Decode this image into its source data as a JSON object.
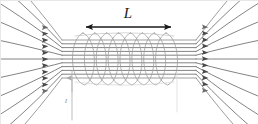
{
  "figure": {
    "kind": "physics-diagram",
    "background_color": "#ffffff",
    "width": 258,
    "height": 124
  },
  "labels": {
    "length_label": "L",
    "current_label": "I"
  },
  "chart_data": {
    "type": "diagram",
    "title": "",
    "elements": [
      "length-dimension-arrow",
      "solenoid-coil",
      "magnetic-field-lines",
      "current-direction-arrow"
    ]
  },
  "dimension_arrow": {
    "x_start": 86,
    "x_end": 171,
    "y": 27,
    "color": "#1a1a1a",
    "stroke_width": 1.6,
    "head_size": 5.5,
    "double_headed": true
  },
  "label_positions": {
    "length_label_x": 128,
    "length_label_y": 18,
    "current_label_x": 66,
    "current_label_y": 103
  },
  "coil": {
    "turns": 8,
    "x_left": 77,
    "x_right": 172,
    "center_y": 59,
    "ry": 26,
    "rx": 7.5,
    "color": "#9a9a9a",
    "stroke_width": 0.8
  },
  "field_lines": {
    "count": 11,
    "color_core": "#5a5a5a",
    "color_outer": "#7d7d7d",
    "stroke_width": 0.75,
    "inner_x_left": 62,
    "inner_x_right": 196,
    "inner_y_top": 40,
    "inner_y_bottom": 78,
    "arrow_x_left": 48,
    "arrow_x_right": 208,
    "arrow_direction": "right",
    "spread_factor": 3.1
  },
  "current_indicator": {
    "line_x": 72,
    "line_y_top": 71,
    "line_y_bottom": 120,
    "arrow_tip_y": 78,
    "color": "#b5b5b5",
    "stroke_width": 0.9
  },
  "secondary_guide": {
    "line_x": 177,
    "line_y_top": 73,
    "line_y_bottom": 112,
    "color": "#dcdcdc",
    "stroke_width": 0.8
  },
  "frame": {
    "border_color": "#e8e8e8"
  }
}
